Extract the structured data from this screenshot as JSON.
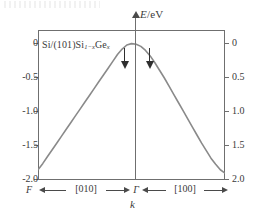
{
  "figure": {
    "y_axis": {
      "title_symbol": "E",
      "title_unit": "/eV",
      "title_full": "E/eV",
      "left_tick_labels": [
        "0",
        "-0.5",
        "-1.0",
        "-1.5",
        "-2.0"
      ],
      "right_tick_labels": [
        "0",
        "0.5",
        "1.0",
        "1.5",
        "2.0"
      ],
      "range_min": -2.0,
      "range_max": 0.2
    },
    "x_axis": {
      "name": "k",
      "left_endpoint": "F",
      "center_point": "Γ",
      "right_endpoint": "B",
      "left_direction": "[010]",
      "right_direction": "[100]"
    },
    "series_label": {
      "prefix": "Si/(101)Si",
      "sub1": "1−x",
      "mid": "Ge",
      "sub2": "x",
      "full": "Si/(101)Si1−xGex"
    },
    "annotations": [
      {
        "name": "arrow-left-of-gamma",
        "symbol": "↓"
      },
      {
        "name": "arrow-right-of-gamma",
        "symbol": "↓"
      }
    ],
    "colors": {
      "curve": "#8a8a8a",
      "axis": "#6f6f6f",
      "text": "#3a3a3a",
      "arrow": "#2f2f2f",
      "background": "#ffffff"
    }
  },
  "chart_data": {
    "type": "line",
    "title": "",
    "xlabel": "k",
    "ylabel": "E/eV",
    "xlim": [
      -1,
      1
    ],
    "ylim": [
      -2.0,
      0.2
    ],
    "grid": false,
    "legend": null,
    "xtick_labels": [
      "F",
      "Γ",
      "B"
    ],
    "xtick_positions": [
      -1,
      0,
      1
    ],
    "ytick_labels_left": [
      "0",
      "-0.5",
      "-1.0",
      "-1.5",
      "-2.0"
    ],
    "ytick_values_left": [
      0,
      -0.5,
      -1.0,
      -1.5,
      -2.0
    ],
    "ytick_labels_right": [
      "0",
      "0.5",
      "1.0",
      "1.5",
      "2.0"
    ],
    "series": [
      {
        "name": "Si/(101)Si1-xGex valence band",
        "color": "#8a8a8a",
        "x": [
          -1.0,
          -0.95,
          -0.9,
          -0.85,
          -0.8,
          -0.75,
          -0.7,
          -0.65,
          -0.6,
          -0.55,
          -0.5,
          -0.45,
          -0.4,
          -0.35,
          -0.3,
          -0.25,
          -0.2,
          -0.15,
          -0.1,
          -0.05,
          0.0,
          0.05,
          0.1,
          0.15,
          0.2,
          0.25,
          0.3,
          0.35,
          0.4,
          0.45,
          0.5,
          0.55,
          0.6,
          0.65,
          0.7,
          0.75,
          0.8,
          0.85,
          0.9,
          0.95,
          1.0
        ],
        "y": [
          -1.85,
          -1.76,
          -1.66,
          -1.56,
          -1.46,
          -1.36,
          -1.26,
          -1.16,
          -1.06,
          -0.96,
          -0.86,
          -0.76,
          -0.66,
          -0.56,
          -0.46,
          -0.36,
          -0.26,
          -0.16,
          -0.08,
          -0.02,
          0.0,
          -0.01,
          -0.04,
          -0.1,
          -0.18,
          -0.28,
          -0.39,
          -0.5,
          -0.62,
          -0.74,
          -0.86,
          -0.98,
          -1.1,
          -1.22,
          -1.34,
          -1.46,
          -1.57,
          -1.68,
          -1.77,
          -1.85,
          -1.9
        ]
      }
    ],
    "annotations": [
      {
        "label": "↓",
        "x": -0.13,
        "y": -0.05,
        "note": "down arrow left of Gamma"
      },
      {
        "label": "↓",
        "x": 0.11,
        "y": -0.05,
        "note": "down arrow right of Gamma"
      },
      {
        "label": "Si/(101)Si1-xGex",
        "x": -0.93,
        "y": -0.08,
        "note": "sample label inside plot"
      }
    ]
  }
}
